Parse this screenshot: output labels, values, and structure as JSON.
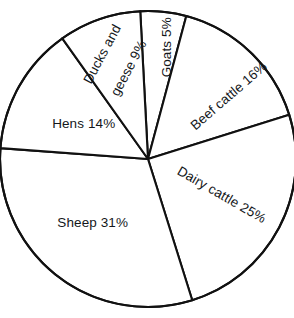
{
  "chart_data": {
    "type": "pie",
    "title": "",
    "subtitle": "",
    "xlabel": "",
    "ylabel": "",
    "legend_position": "none",
    "grid": false,
    "labels_inside_slices": true,
    "units": "percent",
    "total": 100,
    "categories": [
      "Goats",
      "Beef cattle",
      "Dairy cattle",
      "Sheep",
      "Hens",
      "Ducks and geese"
    ],
    "values": [
      5,
      16,
      25,
      31,
      14,
      9
    ],
    "slices": [
      {
        "name": "Goats",
        "value": 5,
        "label": "Goats 5%",
        "label_lines": [
          "Goats 5%"
        ],
        "start_angle_deg": -3,
        "end_angle_deg": 15,
        "label_rotation_deg": -90,
        "label_x": 167,
        "label_y": 55
      },
      {
        "name": "Beef cattle",
        "value": 16,
        "label": "Beef cattle 16%",
        "label_lines": [
          "Beef cattle 16%"
        ],
        "start_angle_deg": 15,
        "end_angle_deg": 72.6,
        "label_rotation_deg": -41,
        "label_x": 223,
        "label_y": 101
      },
      {
        "name": "Dairy cattle",
        "value": 25,
        "label": "Dairy cattle 25%",
        "label_lines": [
          "Dairy cattle 25%"
        ],
        "start_angle_deg": 72.6,
        "end_angle_deg": 162.6,
        "label_rotation_deg": 30,
        "label_x": 215,
        "label_y": 191
      },
      {
        "name": "Sheep",
        "value": 31,
        "label": "Sheep 31%",
        "label_lines": [
          "Sheep 31%"
        ],
        "start_angle_deg": 162.6,
        "end_angle_deg": 274.2,
        "label_rotation_deg": 0,
        "label_x": 85,
        "label_y": 223
      },
      {
        "name": "Hens",
        "value": 14,
        "label": "Hens 14%",
        "label_lines": [
          "Hens 14%"
        ],
        "start_angle_deg": 274.2,
        "end_angle_deg": 324.6,
        "label_rotation_deg": 0,
        "label_x": 76,
        "label_y": 124
      },
      {
        "name": "Ducks and geese",
        "value": 9,
        "label": "Ducks and geese 9%",
        "label_lines": [
          "Ducks and",
          "geese 9%"
        ],
        "label_line_1": "Ducks and",
        "label_line_2": "geese 9%",
        "start_angle_deg": 324.6,
        "end_angle_deg": 357,
        "label_rotation_deg": -62,
        "label_x": 112,
        "label_y": 68
      }
    ],
    "geometry": {
      "center_x": 148,
      "center_y": 159,
      "radius": 148
    },
    "style": {
      "slice_fill": "#ffffff",
      "stroke_color": "#111111",
      "text_color": "#14171a",
      "background": "#ffffff"
    }
  }
}
